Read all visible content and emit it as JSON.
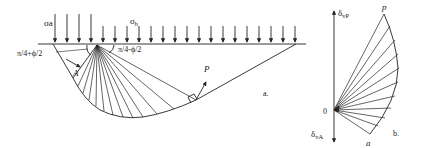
{
  "figure": {
    "panel_a": {
      "label": "a.",
      "load_left": "σa",
      "load_left_sub": "a",
      "load_right": "σ",
      "load_right_sub": "b",
      "angle_left": "π/4+ϕ/2",
      "angle_right": "π/4-ϕ/2",
      "point_A": "A",
      "point_P": "P"
    },
    "panel_b": {
      "label": "b.",
      "axis_top": "δ",
      "axis_top_sub": "vP",
      "axis_bottom": "δ",
      "axis_bottom_sub": "vA",
      "origin": "0",
      "point_p": "p",
      "point_a": "a"
    },
    "colors": {
      "line": "#222222",
      "background": "#ffffff"
    }
  }
}
